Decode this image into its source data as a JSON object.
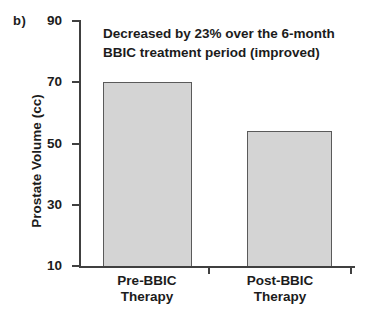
{
  "panel": {
    "label": "b)"
  },
  "chart_data": {
    "type": "bar",
    "title": "",
    "annotation": {
      "line1": "Decreased by 23% over the 6-month",
      "line2": "BBIC treatment period (improved)"
    },
    "ylabel": "Prostate Volume (cc)",
    "xlabel": "",
    "ylim": [
      10,
      90
    ],
    "yticks": [
      10,
      30,
      50,
      70,
      90
    ],
    "categories": [
      {
        "line1": "Pre-BBIC",
        "line2": "Therapy"
      },
      {
        "line1": "Post-BBIC",
        "line2": "Therapy"
      }
    ],
    "values": [
      70,
      54
    ],
    "grid": false,
    "legend": "none",
    "colors": {
      "background": "#ffffff",
      "bar_fill": "#d4d4d4",
      "bar_border": "#5a5a5a",
      "axis": "#404040",
      "text": "#1c1c1c"
    }
  }
}
